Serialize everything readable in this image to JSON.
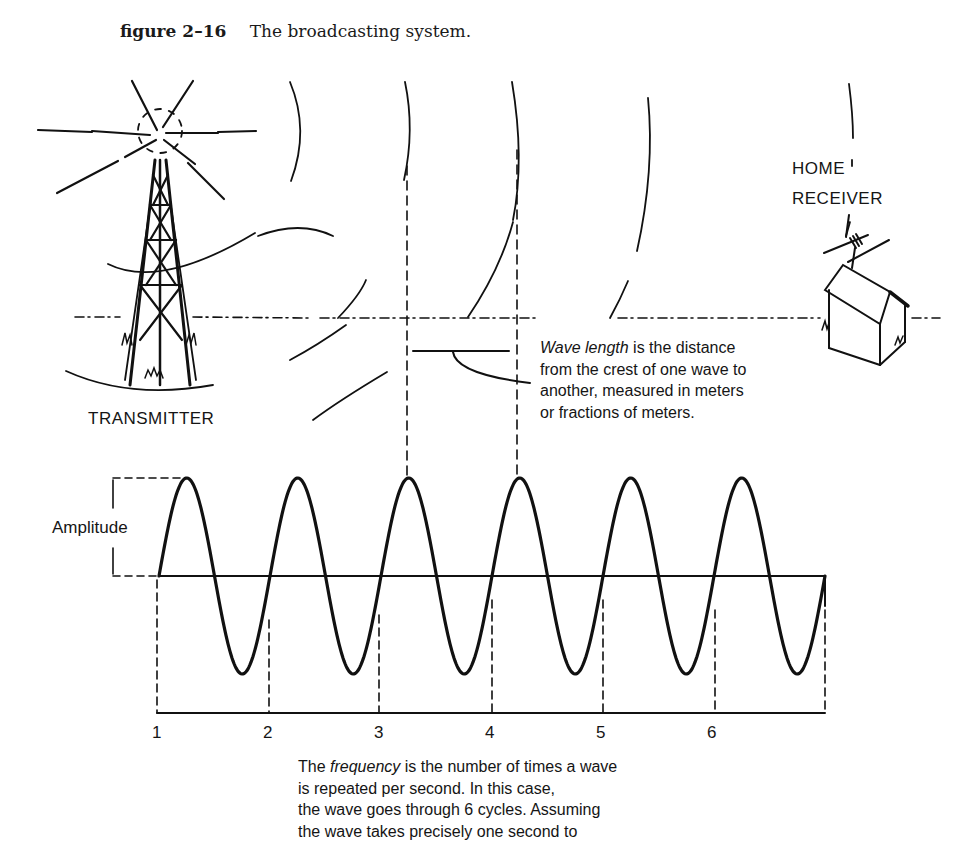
{
  "caption": {
    "figure_number": "figure 2–16",
    "title": "The broadcasting system."
  },
  "labels": {
    "transmitter": "TRANSMITTER",
    "home_receiver_line1": "HOME",
    "home_receiver_line2": "RECEIVER",
    "amplitude": "Amplitude"
  },
  "wavelength_note": {
    "term": "Wave length",
    "line1_rest": " is the distance",
    "line2": "from the crest of one wave to",
    "line3": "another, measured in meters",
    "line4": "or fractions of meters."
  },
  "frequency_note": {
    "line1_pre": "The ",
    "term": "frequency",
    "line1_rest": " is the number of times a wave",
    "line2": "is repeated per second. In this case,",
    "line3": "the wave goes through 6 cycles. Assuming",
    "line4": "the wave takes precisely one second to"
  },
  "cycle_ticks": [
    "1",
    "2",
    "3",
    "4",
    "5",
    "6"
  ],
  "wave": {
    "cycles": 6,
    "start_x": 159,
    "cycle_width": 111,
    "axis_y": 576,
    "amplitude_px": 98,
    "baseline_y": 713
  },
  "colors": {
    "ink": "#111111",
    "background": "#ffffff"
  }
}
